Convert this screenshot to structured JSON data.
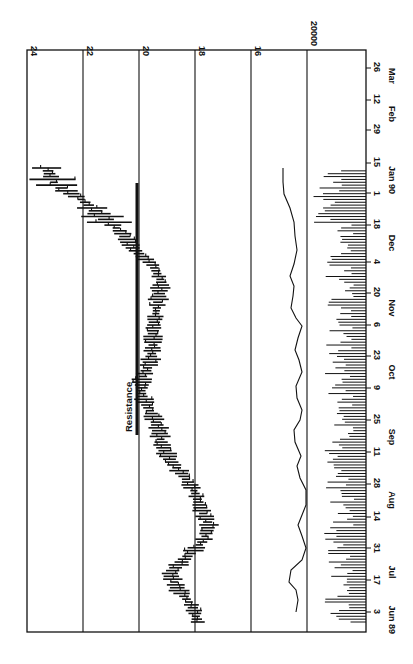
{
  "chart_data": {
    "type": "bar",
    "subtype": "OHLC price bars with volume histogram and volume moving-average line (figure printed rotated 90° clockwise)",
    "title": "",
    "orientation": "rotated-90",
    "price_axis": {
      "ticks": [
        24,
        22,
        20,
        18,
        16
      ],
      "range": [
        14,
        24
      ],
      "grid": true
    },
    "volume_axis": {
      "ticks": [
        "20000"
      ],
      "grid": true
    },
    "date_axis": {
      "tick_labels": [
        "3",
        "17",
        "31",
        "14",
        "28",
        "11",
        "25",
        "9",
        "23",
        "6",
        "20",
        "4",
        "18",
        "1",
        "15",
        "29",
        "12",
        "26"
      ],
      "month_labels": [
        "Jun 89",
        "Jul",
        "Aug",
        "Sep",
        "Oct",
        "Nov",
        "Dec",
        "Jan 90",
        "Feb",
        "Mar"
      ]
    },
    "annotations": [
      {
        "text": "Resistance",
        "type": "horizontal-line",
        "price": 20.1,
        "from": "Sep 25",
        "to": "Dec 18"
      }
    ],
    "series": [
      {
        "name": "Price (weekly close approx.)",
        "x": [
          "Jul 3",
          "Jul 10",
          "Jul 17",
          "Jul 24",
          "Jul 31",
          "Aug 7",
          "Aug 14",
          "Aug 21",
          "Aug 28",
          "Sep 4",
          "Sep 11",
          "Sep 18",
          "Sep 25",
          "Oct 2",
          "Oct 9",
          "Oct 16",
          "Oct 23",
          "Oct 30",
          "Nov 6",
          "Nov 13",
          "Nov 20",
          "Nov 27",
          "Dec 4",
          "Dec 11",
          "Dec 18",
          "Dec 25",
          "Jan 1",
          "Jan 8",
          "Jan 15"
        ],
        "values": [
          17.9,
          18.1,
          18.6,
          18.9,
          18.3,
          17.7,
          17.5,
          17.8,
          18.0,
          18.4,
          18.9,
          19.2,
          19.3,
          19.6,
          19.9,
          19.9,
          19.6,
          19.5,
          19.5,
          19.4,
          19.3,
          19.2,
          19.5,
          20.2,
          20.6,
          21.3,
          22.0,
          23.0,
          23.3
        ]
      },
      {
        "name": "Volume moving average",
        "x": [
          "Jul 3",
          "Jul 17",
          "Jul 31",
          "Aug 14",
          "Aug 28",
          "Sep 11",
          "Sep 25",
          "Oct 9",
          "Oct 23",
          "Nov 6",
          "Nov 20",
          "Dec 4",
          "Dec 18",
          "Jan 1",
          "Jan 15"
        ],
        "values": [
          19000,
          20200,
          18200,
          18500,
          18400,
          19000,
          19500,
          19000,
          19800,
          20000,
          19600,
          20500,
          20700,
          20800,
          21500
        ]
      }
    ],
    "volume_bars": "daily volume histogram along date axis (roughly 10000–30000)"
  },
  "labels": {
    "price_ticks": [
      "24",
      "22",
      "20",
      "18",
      "16"
    ],
    "volume_tick": "20000",
    "resistance": "Resistance",
    "dates": [
      "3",
      "17",
      "31",
      "14",
      "28",
      "11",
      "25",
      "9",
      "23",
      "6",
      "20",
      "4",
      "18",
      "1",
      "15",
      "29",
      "12",
      "26"
    ],
    "months": [
      "Jun 89",
      "Jul",
      "Aug",
      "Sep",
      "Oct",
      "Nov",
      "Dec",
      "Jan 90",
      "Feb",
      "Mar"
    ]
  }
}
